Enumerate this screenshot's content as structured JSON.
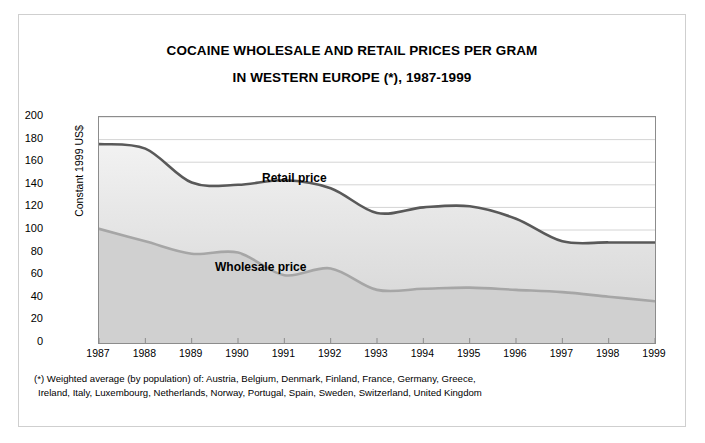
{
  "title": {
    "line1": "COCAINE WHOLESALE AND RETAIL PRICES PER GRAM",
    "line2": "IN WESTERN EUROPE (*), 1987-1999"
  },
  "footnote": {
    "line1": "(*) Weighted average (by population) of: Austria, Belgium, Denmark, Finland, France, Germany, Greece,",
    "line2": "Ireland, Italy, Luxembourg, Netherlands, Norway, Portugal, Spain, Sweden, Switzerland, United Kingdom"
  },
  "annotations": {
    "retail": "Retail price",
    "wholesale": "Wholesale price"
  },
  "colors": {
    "retail_line": "#595959",
    "wholesale_line": "#a6a6a6",
    "band_fill_top": "#f2f2f2",
    "band_fill_bottom": "#d9d9d9",
    "lower_fill": "#d0d0d0",
    "gridline": "#d4d4d4",
    "axis": "#8c8c8c",
    "frame": "#cfcfcf"
  },
  "chart_data": {
    "type": "line",
    "title": "COCAINE WHOLESALE AND RETAIL PRICES PER GRAM IN WESTERN EUROPE (*), 1987-1999",
    "xlabel": "",
    "ylabel": "Constant 1999 US$",
    "categories": [
      "1987",
      "1988",
      "1989",
      "1990",
      "1991",
      "1992",
      "1993",
      "1994",
      "1995",
      "1996",
      "1997",
      "1998",
      "1999"
    ],
    "x": [
      1987,
      1988,
      1989,
      1990,
      1991,
      1992,
      1993,
      1994,
      1995,
      1996,
      1997,
      1998,
      1999
    ],
    "ylim": [
      0,
      200
    ],
    "yticks": [
      0,
      20,
      40,
      60,
      80,
      100,
      120,
      140,
      160,
      180,
      200
    ],
    "grid": true,
    "legend": "inline-annotations",
    "series": [
      {
        "name": "Retail price",
        "color": "#595959",
        "values": [
          176,
          172,
          142,
          140,
          144,
          137,
          115,
          120,
          121,
          110,
          90,
          89,
          89
        ]
      },
      {
        "name": "Wholesale price",
        "color": "#a6a6a6",
        "values": [
          101,
          90,
          79,
          80,
          60,
          66,
          47,
          48,
          49,
          47,
          45,
          41,
          37
        ]
      }
    ]
  }
}
